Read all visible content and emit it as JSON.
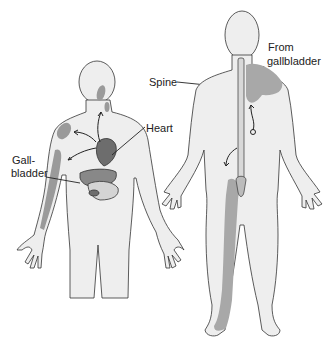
{
  "labels": {
    "heart": "Heart",
    "gall1": "Gall-",
    "gall2": "bladder",
    "spine": "Spine",
    "from1": "From",
    "from2": "gallbladder"
  },
  "colors": {
    "skin": "#eeeeee",
    "outline": "#333333",
    "referred": "#9a9a9a",
    "organ": "#6d6d6d"
  }
}
